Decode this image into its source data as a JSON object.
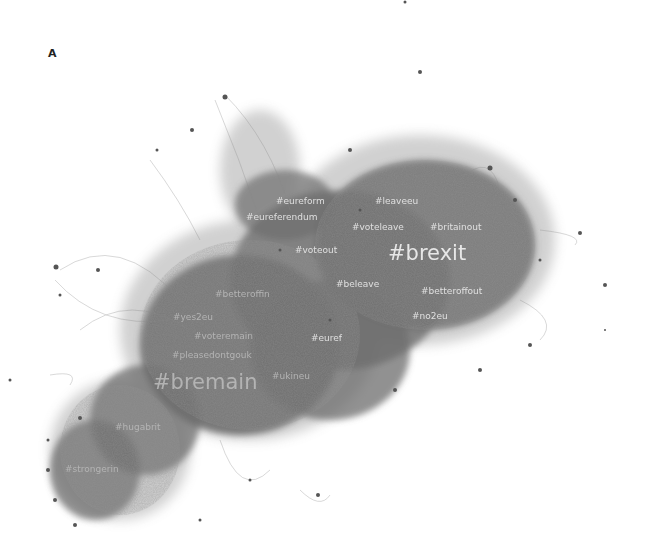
{
  "figure": {
    "panel_label": "A",
    "type": "hashtag co-occurrence network"
  },
  "hashtags": {
    "brexit": "#brexit",
    "bremain": "#bremain",
    "eureform": "#eureform",
    "leaveeu": "#leaveeu",
    "eureferendum": "#eureferendum",
    "voteleave": "#voteleave",
    "britainout": "#britainout",
    "voteout": "#voteout",
    "beleave": "#beleave",
    "betteroffin": "#betteroffin",
    "betteroffout": "#betteroffout",
    "yes2eu": "#yes2eu",
    "no2eu": "#no2eu",
    "voteremain": "#voteremain",
    "euref": "#euref",
    "pleasedontgouk": "#pleasedontgouk",
    "ukineu": "#ukineu",
    "hugabrit": "#hugabrit",
    "strongerin": "#strongerin"
  },
  "colors": {
    "network": "#6e6e6e",
    "network_dark": "#4a4a4a",
    "label": "#e8e8e8",
    "background": "#ffffff"
  }
}
